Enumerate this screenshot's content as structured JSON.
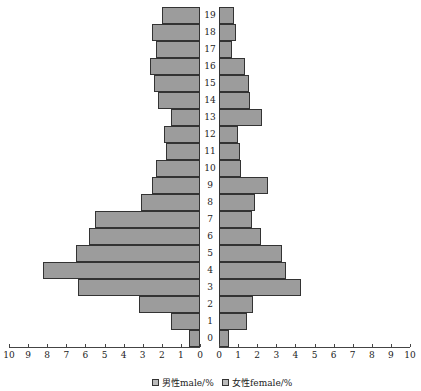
{
  "chart_data": {
    "type": "bar",
    "subtype": "population_pyramid",
    "title": "",
    "categories": [
      "0",
      "1",
      "2",
      "3",
      "4",
      "5",
      "6",
      "7",
      "8",
      "9",
      "10",
      "11",
      "12",
      "13",
      "14",
      "15",
      "16",
      "17",
      "18",
      "19"
    ],
    "series": [
      {
        "name": "男性male/%",
        "side": "left",
        "values": [
          0.6,
          1.5,
          3.2,
          6.4,
          8.2,
          6.5,
          5.8,
          5.5,
          3.1,
          2.5,
          2.3,
          1.8,
          1.9,
          1.5,
          2.2,
          2.4,
          2.6,
          2.3,
          2.5,
          2.0
        ]
      },
      {
        "name": "女性female/%",
        "side": "right",
        "values": [
          0.5,
          1.45,
          1.8,
          4.3,
          3.5,
          3.3,
          2.2,
          1.75,
          1.9,
          2.55,
          1.15,
          1.1,
          1.0,
          2.25,
          1.6,
          1.55,
          1.35,
          0.7,
          0.9,
          0.8
        ]
      }
    ],
    "xlabel": "",
    "ylabel": "",
    "xlim": [
      0,
      10
    ],
    "x_ticks_left": [
      "10",
      "9",
      "8",
      "7",
      "6",
      "5",
      "4",
      "3",
      "2",
      "1",
      "0"
    ],
    "x_ticks_right": [
      "0",
      "1",
      "2",
      "3",
      "4",
      "5",
      "6",
      "7",
      "8",
      "9",
      "10"
    ],
    "grid": false,
    "legend_position": "bottom",
    "colors": {
      "bar_fill": "#9c9c9c",
      "bar_border": "#333333"
    }
  },
  "legend": {
    "male_label": "男性male/%",
    "female_label": "女性female/%"
  }
}
